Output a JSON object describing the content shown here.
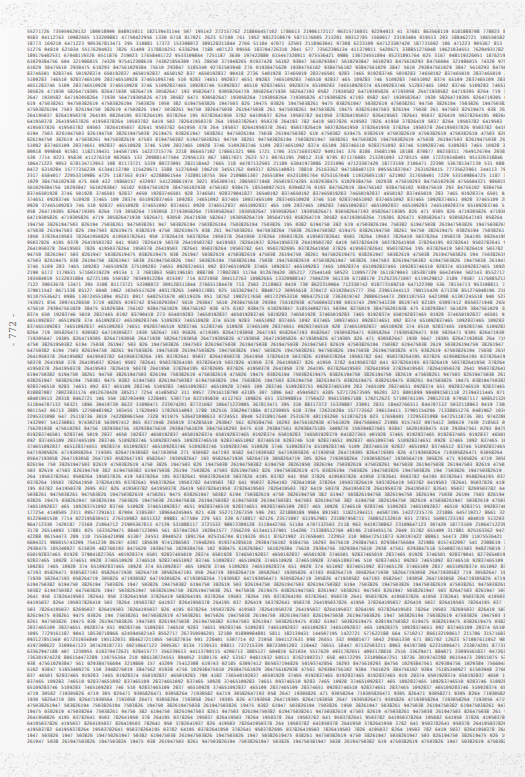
{
  "page": {
    "kind": "scanned-numeric-table-page",
    "folio": "- 772 -",
    "background_color": "#fefefe",
    "ink_color": "#2b2b2b",
    "text_block": {
      "left": 27,
      "top": 29,
      "width": 478,
      "height": 717,
      "line_height": 6.02,
      "font_size": 4.6,
      "alignment": "justified",
      "line_count": 119,
      "description": "Dense full-page block of space-separated numeric digit groups, fully justified to both margins, rendered at microtype scale so individual digits are not resolvable."
    },
    "content": {
      "character_set": "0123456789",
      "group_length_range": [
        3,
        12
      ],
      "body_lines": [
        "7681863568119618188870877802383117649126704203852177254414850523110957729161187904318530718966424594502143855271726735959620132180018999848915811182139431144507195142272157762218866457102178661321906172117063157160319229491341 3",
        "8170212623571007611952981231897958711760852132010931278515600172319348401951320318846272110655018270349912284015307714 0221958304112763109826651332098814775042295613306718",
        "6781347139531088117372153398072309128311844276651184470713250321189630419730862231096471233074201877316921064712239053",
        "7735623961344113790115420671338851276048196210345517620493178265140931788102516336294718840712309556183704726310284157",
        "2190231765840172295331098647251187363019742288061544732891107553642109861307245518940523189176402531670481193260511876",
        "6043219860157432097541230861974302185630974128650371948265019374285610293847561029384756102938475610293847561029384756",
        "1853409276150394827601938475620193847561029384756102938475610293847561029384756102938475610293847561029384756102938475",
        "9041827365401928374650192837465019283746501928374650192837465019283746501928374650192837465019283746501928374650192837",
        "3746510928374651092837465109283746510928374651092837465109283746510928374651092837465109283746510928374651092837465109",
        "2837465109283746510928374651092837465109283746510928374651092837465109283746510928374651092837465109283746510928374651",
        "7193058264719305826471930582647193058264719305826471930582647193058264719305826471930582647193058264719305826471930582",
        "6471930582647193058264719305826471930582647193058264719305826471930582647193058264719305826471930582647193058264719305",
        "5038261947503826194750382619475038261947503826194750382619475038261947503826194750382619475038261947503826194750382619",
        "4750382619475038261947503826194750382619475038261947503826194750382619475038261947503826194750382619475038261947503826",
        "8264195037826419503782641950378264195037826419503782641950378264195037826419503782641950378264195037826419503782641950",
        "3782641950378264195037826419503782641950378264195037826419503782641950378264195037826419503782641950378264195037826419",
        "9503782641950378264195037826419503782641950378264195037826419503782641950378264195037826419503782641950378264195037826",
        "2619475038261947503826194750382619475038261947503826194750382619475038261947503826194750382619475038261947503826194750",
        "1947503826194750382619475038261947503826194750382619475038261947503826194750382619475038261947503826194750382619475038",
        "7510928374651092837465109283746510928374651092837465109283746510928374651092837465109283746510928374651092837465109283"
      ]
    }
  }
}
